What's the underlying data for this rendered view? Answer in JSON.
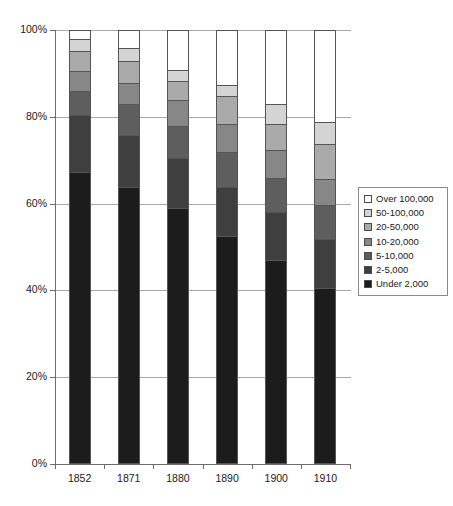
{
  "chart_data": {
    "type": "bar",
    "subtype": "stacked-percentage",
    "title": "",
    "xlabel": "",
    "ylabel": "",
    "categories": [
      "1852",
      "1871",
      "1880",
      "1890",
      "1900",
      "1910"
    ],
    "ylim": [
      0,
      100
    ],
    "ytick_labels": [
      "0%",
      "20%",
      "40%",
      "60%",
      "80%",
      "100%"
    ],
    "ytick_values": [
      0,
      20,
      40,
      60,
      80,
      100
    ],
    "grid": true,
    "legend_position": "right",
    "stack_order_bottom_to_top": [
      "Under 2,000",
      "2-5,000",
      "5-10,000",
      "10-20,000",
      "20-50,000",
      "50-100,000",
      "Over 100,000"
    ],
    "series": [
      {
        "name": "Under 2,000",
        "color": "#1c1c1c",
        "values": [
          67.3,
          64.0,
          59.0,
          52.5,
          47.0,
          40.5
        ]
      },
      {
        "name": "2-5,000",
        "color": "#3f3f3f",
        "values": [
          13.3,
          12.0,
          11.5,
          11.5,
          11.0,
          11.3
        ]
      },
      {
        "name": "5-10,000",
        "color": "#5e5e5e",
        "values": [
          5.4,
          7.0,
          7.5,
          8.0,
          8.0,
          8.0
        ]
      },
      {
        "name": "10-20,000",
        "color": "#878787",
        "values": [
          4.8,
          5.0,
          6.0,
          6.5,
          6.5,
          6.0
        ]
      },
      {
        "name": "20-50,000",
        "color": "#aaaaaa",
        "values": [
          4.5,
          5.0,
          4.5,
          6.5,
          6.0,
          8.0
        ]
      },
      {
        "name": "50-100,000",
        "color": "#d4d4d4",
        "values": [
          2.9,
          3.0,
          2.5,
          2.5,
          4.5,
          5.2
        ]
      },
      {
        "name": "Over 100,000",
        "color": "#ffffff",
        "values": [
          1.8,
          4.0,
          9.0,
          12.5,
          17.0,
          21.0
        ]
      }
    ],
    "legend_entries": [
      {
        "label": "Over 100,000",
        "color": "#ffffff"
      },
      {
        "label": "50-100,000",
        "color": "#d4d4d4"
      },
      {
        "label": "20-50,000",
        "color": "#aaaaaa"
      },
      {
        "label": "10-20,000",
        "color": "#878787"
      },
      {
        "label": "5-10,000",
        "color": "#5e5e5e"
      },
      {
        "label": "2-5,000",
        "color": "#3f3f3f"
      },
      {
        "label": "Under 2,000",
        "color": "#1c1c1c"
      }
    ]
  },
  "axis": {
    "y_ticks": [
      {
        "label": "100%",
        "value": 100
      },
      {
        "label": "80%",
        "value": 80
      },
      {
        "label": "60%",
        "value": 60
      },
      {
        "label": "40%",
        "value": 40
      },
      {
        "label": "20%",
        "value": 20
      },
      {
        "label": "0%",
        "value": 0
      }
    ],
    "x_ticks": [
      "1852",
      "1871",
      "1880",
      "1890",
      "1900",
      "1910"
    ]
  },
  "caption": {
    "partial_text": ""
  }
}
